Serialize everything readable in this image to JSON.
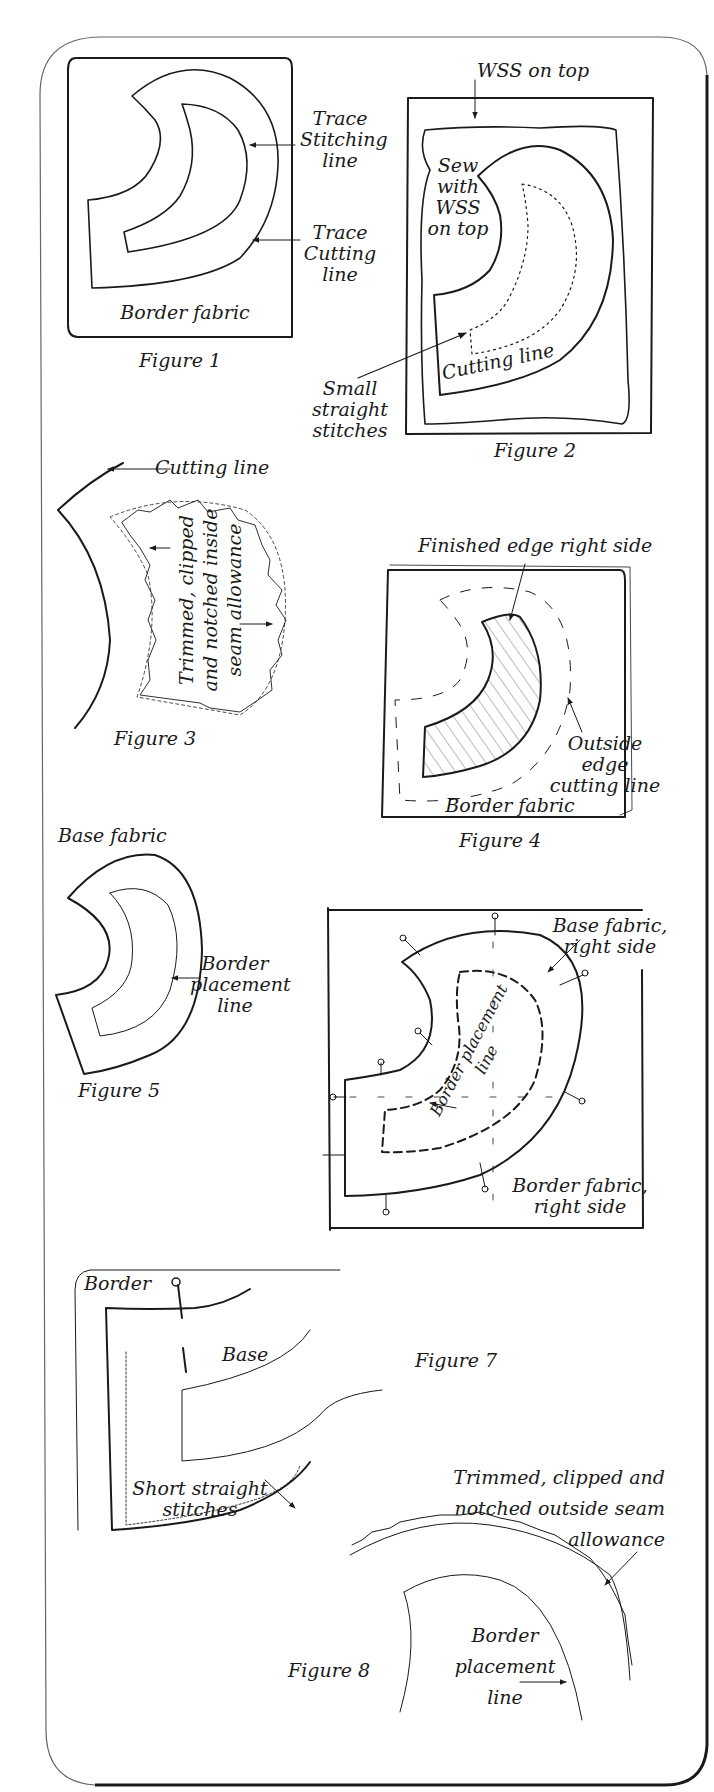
{
  "colors": {
    "ink": "#1a1a1a",
    "card_border": "#555555",
    "paper": "#ffffff"
  },
  "figures": [
    {
      "id": 1,
      "caption": "Figure 1",
      "labels": {
        "fabric": "Border fabric",
        "stitching": "Trace\nStitching\nline",
        "cutting": "Trace\nCutting\nline"
      }
    },
    {
      "id": 2,
      "caption": "Figure 2",
      "labels": {
        "wss_top": "WSS on top",
        "sew_with": "Sew\nwith\nWSS\non top",
        "small_stitches": "Small\nstraight\nstitches",
        "cutting": "Cutting line"
      }
    },
    {
      "id": 3,
      "caption": "Figure 3",
      "labels": {
        "cutting": "Cutting line",
        "trimmed": "Trimmed, clipped\nand notched inside\nseam allowance"
      }
    },
    {
      "id": 4,
      "caption": "Figure 4",
      "labels": {
        "finished_edge": "Finished edge right side",
        "outside_edge": "Outside edge\ncutting line",
        "fabric": "Border fabric"
      }
    },
    {
      "id": 5,
      "caption": "Figure 5",
      "labels": {
        "base": "Base fabric",
        "placement": "Border\nplacement\nline"
      }
    },
    {
      "id": 6,
      "caption": "",
      "labels": {
        "base": "Base fabric,\nright side",
        "border": "Border fabric,\nright side",
        "placement": "Border placement\nline"
      }
    },
    {
      "id": 7,
      "caption": "Figure 7",
      "labels": {
        "border": "Border",
        "base": "Base",
        "stitches": "Short straight\nstitches"
      }
    },
    {
      "id": 8,
      "caption": "Figure 8",
      "labels": {
        "trimmed": "Trimmed, clipped and\nnotched outside seam\nallowance",
        "placement": "Border\nplacement\nline"
      }
    }
  ]
}
